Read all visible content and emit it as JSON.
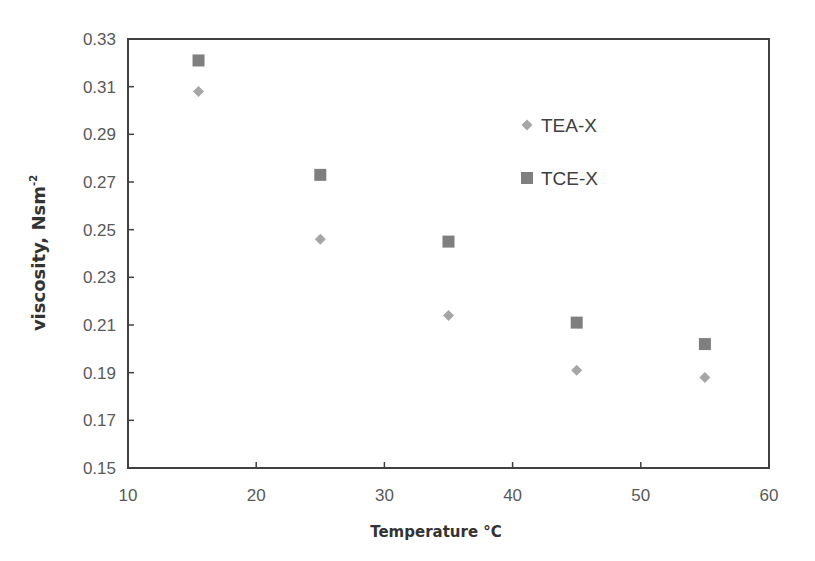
{
  "chart_data": {
    "type": "scatter",
    "title": "",
    "xlabel": "Temperature °C",
    "ylabel": "viscosity, Nsm⁻²",
    "xlim": [
      10,
      60
    ],
    "ylim": [
      0.15,
      0.33
    ],
    "x_ticks": [
      10,
      20,
      30,
      40,
      50,
      60
    ],
    "x_tick_labels": [
      "10",
      "20",
      "30",
      "40",
      "50",
      "60"
    ],
    "y_ticks": [
      0.15,
      0.17,
      0.19,
      0.21,
      0.23,
      0.25,
      0.27,
      0.29,
      0.31,
      0.33
    ],
    "y_tick_labels": [
      "0.15",
      "0.17",
      "0.19",
      "0.21",
      "0.23",
      "0.25",
      "0.27",
      "0.29",
      "0.31",
      "0.33"
    ],
    "grid": false,
    "legend_position": "upper right (inside plot)",
    "series": [
      {
        "name": "TEA-X",
        "marker": "diamond",
        "color": "#a6a6a6",
        "x": [
          15.5,
          25,
          35,
          45,
          55
        ],
        "y": [
          0.308,
          0.246,
          0.214,
          0.191,
          0.188
        ]
      },
      {
        "name": "TCE-X",
        "marker": "square",
        "color": "#7f7f7f",
        "x": [
          15.5,
          25,
          35,
          45,
          55
        ],
        "y": [
          0.321,
          0.273,
          0.245,
          0.211,
          0.202
        ]
      }
    ]
  },
  "labels": {
    "xlabel_main": "Temperature ",
    "xlabel_unit": "°C",
    "ylabel_main": "viscosity, Nsm",
    "ylabel_sup": "-2"
  }
}
